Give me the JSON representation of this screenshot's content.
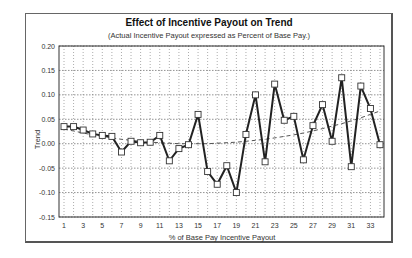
{
  "chart_data": {
    "type": "line",
    "title": "Effect of Incentive Payout on Trend",
    "subtitle": "(Actual Incentive Payout expressed as Percent of Base Pay.)",
    "xlabel": "% of Base Pay Incentive Payout",
    "ylabel": "Trend",
    "ylim": [
      -0.15,
      0.2
    ],
    "yticks": [
      "0.20",
      "0.15",
      "0.10",
      "0.05",
      "0.00",
      "-0.05",
      "-0.10",
      "-0.15"
    ],
    "ytick_values": [
      0.2,
      0.15,
      0.1,
      0.05,
      0.0,
      -0.05,
      -0.1,
      -0.15
    ],
    "xticks": [
      "1",
      "3",
      "5",
      "7",
      "9",
      "11",
      "13",
      "15",
      "17",
      "19",
      "21",
      "23",
      "25",
      "27",
      "29",
      "31",
      "33"
    ],
    "x": [
      1,
      2,
      3,
      4,
      5,
      6,
      7,
      8,
      9,
      10,
      11,
      12,
      13,
      14,
      15,
      16,
      17,
      18,
      19,
      20,
      21,
      22,
      23,
      24,
      25,
      26,
      27,
      28,
      29,
      30,
      31,
      32,
      33,
      34
    ],
    "grid": true,
    "legend": null,
    "series": [
      {
        "name": "Trend",
        "style": "solid line with hollow square markers",
        "values": [
          0.035,
          0.035,
          0.028,
          0.02,
          0.017,
          0.015,
          -0.017,
          0.005,
          0.002,
          0.003,
          0.017,
          -0.035,
          -0.01,
          -0.002,
          0.06,
          -0.057,
          -0.083,
          -0.045,
          -0.1,
          0.019,
          0.1,
          -0.037,
          0.122,
          0.048,
          0.056,
          -0.033,
          0.037,
          0.08,
          0.005,
          0.135,
          -0.047,
          0.118,
          0.072,
          -0.002
        ]
      },
      {
        "name": "Trendline (polynomial)",
        "style": "dashed",
        "values": [
          0.03,
          0.026,
          0.022,
          0.018,
          0.015,
          0.012,
          0.009,
          0.007,
          0.005,
          0.003,
          0.002,
          0.001,
          0.0,
          0.0,
          0.0,
          0.0,
          0.001,
          0.002,
          0.003,
          0.005,
          0.007,
          0.009,
          0.012,
          0.015,
          0.018,
          0.022,
          0.026,
          0.031,
          0.036,
          0.041,
          0.047,
          0.053,
          0.06,
          0.067
        ]
      }
    ]
  }
}
